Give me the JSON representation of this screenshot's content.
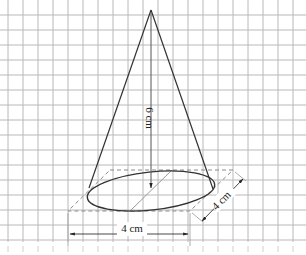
{
  "figure": {
    "type": "cone-diagram",
    "grid": {
      "spacing_px": 15,
      "color": "#b5b5b5"
    },
    "labels": {
      "height": "6 cm",
      "diameter_horizontal": "4 cm",
      "diameter_slanted": "4 cm"
    },
    "colors": {
      "outline": "#333333",
      "dashed": "#8a8a8a",
      "diameter": "#9a9a9a"
    }
  }
}
